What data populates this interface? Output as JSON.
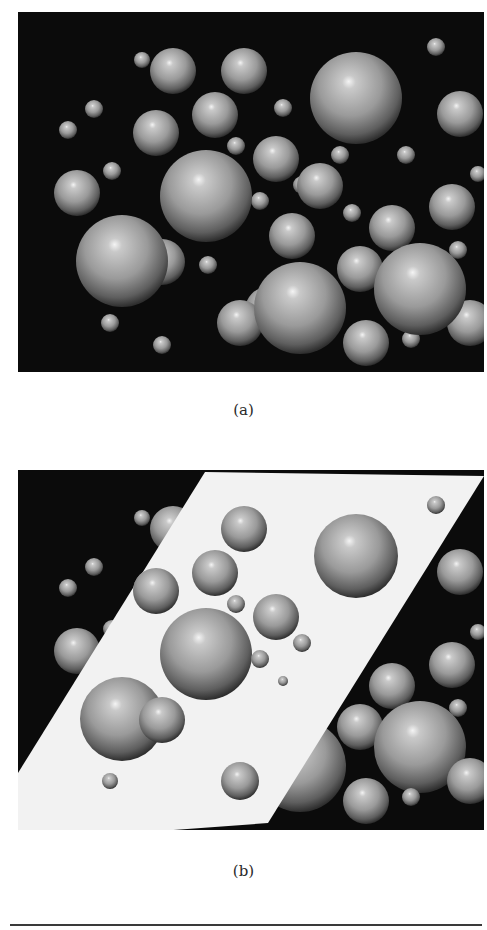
{
  "figure": {
    "panels": [
      {
        "id": "a",
        "caption": "(a)",
        "background": "#0b0b0b",
        "spheres": [
          [
            124,
            48,
            8
          ],
          [
            155,
            59,
            23
          ],
          [
            226,
            59,
            23
          ],
          [
            338,
            86,
            46
          ],
          [
            418,
            35,
            9
          ],
          [
            76,
            97,
            9
          ],
          [
            50,
            118,
            9
          ],
          [
            138,
            121,
            23
          ],
          [
            197,
            103,
            23
          ],
          [
            265,
            96,
            9
          ],
          [
            442,
            102,
            23
          ],
          [
            218,
            134,
            9
          ],
          [
            258,
            147,
            23
          ],
          [
            322,
            143,
            9
          ],
          [
            388,
            143,
            9
          ],
          [
            460,
            162,
            8
          ],
          [
            59,
            181,
            23
          ],
          [
            94,
            159,
            9
          ],
          [
            188,
            184,
            46
          ],
          [
            242,
            189,
            9
          ],
          [
            302,
            174,
            23
          ],
          [
            284,
            173,
            9
          ],
          [
            334,
            201,
            9
          ],
          [
            274,
            224,
            23
          ],
          [
            374,
            216,
            23
          ],
          [
            434,
            195,
            23
          ],
          [
            104,
            249,
            46
          ],
          [
            144,
            250,
            23
          ],
          [
            190,
            253,
            9
          ],
          [
            440,
            238,
            9
          ],
          [
            342,
            257,
            23
          ],
          [
            282,
            296,
            46
          ],
          [
            402,
            277,
            46
          ],
          [
            250,
            298,
            23
          ],
          [
            222,
            311,
            23
          ],
          [
            92,
            311,
            9
          ],
          [
            144,
            333,
            9
          ],
          [
            348,
            331,
            23
          ],
          [
            393,
            327,
            9
          ],
          [
            452,
            311,
            23
          ]
        ]
      },
      {
        "id": "b",
        "caption": "(b)",
        "background": "#0b0b0b",
        "plane": {
          "color": "#f2f2f2",
          "points": [
            [
              187,
              2
            ],
            [
              466,
              6
            ],
            [
              250,
              353
            ],
            [
              142,
              361
            ],
            [
              0,
              361
            ],
            [
              0,
              303
            ]
          ]
        },
        "spheres_behind": [
          [
            124,
            48,
            8
          ],
          [
            155,
            59,
            23
          ],
          [
            76,
            97,
            9
          ],
          [
            50,
            118,
            9
          ],
          [
            138,
            121,
            23
          ],
          [
            94,
            159,
            9
          ],
          [
            59,
            181,
            23
          ],
          [
            442,
            102,
            23
          ],
          [
            460,
            162,
            8
          ],
          [
            434,
            195,
            23
          ],
          [
            374,
            216,
            23
          ],
          [
            440,
            238,
            9
          ],
          [
            342,
            257,
            23
          ],
          [
            402,
            277,
            46
          ],
          [
            348,
            331,
            23
          ],
          [
            393,
            327,
            9
          ],
          [
            452,
            311,
            23
          ],
          [
            282,
            296,
            46
          ]
        ],
        "spheres_front": [
          [
            226,
            59,
            23
          ],
          [
            338,
            86,
            42
          ],
          [
            418,
            35,
            9
          ],
          [
            197,
            103,
            23
          ],
          [
            138,
            121,
            23
          ],
          [
            218,
            134,
            9
          ],
          [
            258,
            147,
            23
          ],
          [
            188,
            184,
            46
          ],
          [
            284,
            173,
            9
          ],
          [
            242,
            189,
            9
          ],
          [
            104,
            249,
            42
          ],
          [
            144,
            250,
            23
          ],
          [
            92,
            311,
            8
          ],
          [
            222,
            311,
            19
          ],
          [
            265,
            211,
            5
          ]
        ]
      }
    ],
    "bottom_rule": true
  }
}
